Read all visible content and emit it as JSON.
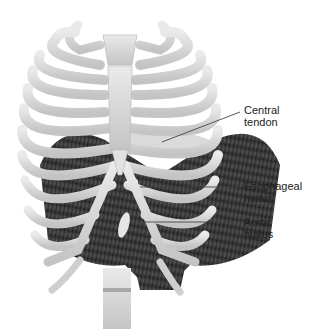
{
  "figure": {
    "colors": {
      "background": "#ffffff",
      "bone": "#dcdcdc",
      "bone_shade": "#b8b8b8",
      "muscle": "#3a3a3a",
      "leader_line": "#444444",
      "label_text": "#222222"
    },
    "labels": [
      {
        "line1": "Central",
        "line2": "tendon"
      },
      {
        "line1": "Esophageal",
        "line2": "hiatus"
      },
      {
        "line1": "Aortic",
        "line2": "hiatus"
      }
    ]
  }
}
